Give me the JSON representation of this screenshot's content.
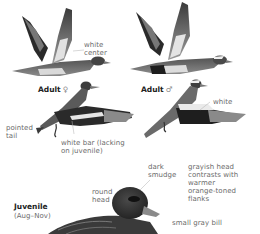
{
  "plate": {
    "figures": [
      {
        "id": "adult-female-flying-up",
        "caption": "Adult",
        "sex_symbol": "♀"
      },
      {
        "id": "adult-male-flying-up",
        "caption": "Adult",
        "sex_symbol": "♂"
      },
      {
        "id": "juvenile-sitting",
        "caption": "Juvenile",
        "subcaption": "(Aug–Nov)"
      }
    ],
    "labels": {
      "white_center": "white\ncenter",
      "white": "white",
      "pointed_tail": "pointed\ntail",
      "white_bar": "white bar (lacking\non juvenile)",
      "round_head": "round\nhead",
      "dark_smudge": "dark\nsmudge",
      "grayish_head": "grayish head\ncontrasts with\nwarmer\norange-toned\nflanks",
      "small_gray_bill": "small gray bill"
    },
    "colors": {
      "label_text": "#6b6b6b",
      "caption_text": "#222222",
      "leader_line": "#9a9a9a",
      "bird_dark": "#2e2e2e",
      "bird_mid": "#7a7a7a",
      "bird_light": "#cfcfcf"
    }
  }
}
